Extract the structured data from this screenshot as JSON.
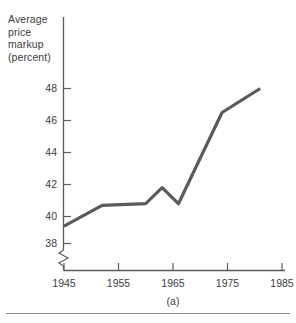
{
  "chart_data": {
    "type": "line",
    "title": "",
    "subtitle": "",
    "caption": "(a)",
    "ylabel_lines": [
      "Average",
      "price",
      "markup",
      "(percent)"
    ],
    "ylabel": "Average price markup (percent)",
    "xlabel": "",
    "xticks": [
      1945,
      1955,
      1965,
      1975,
      1985
    ],
    "xtick_labels": [
      "1945",
      "1955",
      "1965",
      "1975",
      "1985"
    ],
    "yticks": [
      38,
      40,
      42,
      44,
      46,
      48
    ],
    "ytick_labels": [
      "38",
      "40",
      "42",
      "44",
      "46",
      "48"
    ],
    "xlim": [
      1945,
      1987
    ],
    "ylim": [
      37.2,
      49.2
    ],
    "grid": false,
    "legend": false,
    "axis_break": true,
    "axis_break_note": "y-axis broken below 38",
    "line_color": "#5a5a5a",
    "series": [
      {
        "name": "Average price markup",
        "x": [
          1945,
          1952,
          1960,
          1963,
          1966,
          1974,
          1981
        ],
        "values": [
          39.4,
          40.7,
          40.8,
          41.8,
          40.8,
          46.5,
          48.0
        ]
      }
    ]
  },
  "figure": {
    "caption": "(a)"
  }
}
